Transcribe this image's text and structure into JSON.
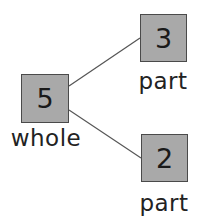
{
  "diagram": {
    "type": "number-bond",
    "whole": {
      "value": "5",
      "label": "whole"
    },
    "parts": [
      {
        "value": "3",
        "label": "part"
      },
      {
        "value": "2",
        "label": "part"
      }
    ],
    "colors": {
      "box_fill": "#a9a9a9",
      "box_border": "#4a4a4a",
      "line": "#555555",
      "text": "#1a1a1a"
    }
  }
}
